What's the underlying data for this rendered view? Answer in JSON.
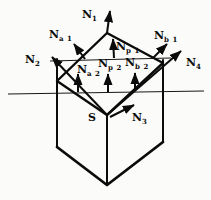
{
  "figure": {
    "background_color": "#fbfbf9",
    "ink_color": "#0b0b0b",
    "source_point_label": "S",
    "normals": {
      "n1": {
        "main": "N",
        "sub": "1"
      },
      "n2": {
        "main": "N",
        "sub": "2"
      },
      "n3": {
        "main": "N",
        "sub": "3"
      },
      "n4": {
        "main": "N",
        "sub": "4"
      },
      "na1": {
        "main": "N",
        "sub": "a 1"
      },
      "np1": {
        "main": "N",
        "sub": "p 1"
      },
      "nb1": {
        "main": "N",
        "sub": "b 1"
      },
      "na2": {
        "main": "N",
        "sub": "a 2"
      },
      "np2": {
        "main": "N",
        "sub": "p 2"
      },
      "nb2": {
        "main": "N",
        "sub": "b 2"
      }
    }
  }
}
